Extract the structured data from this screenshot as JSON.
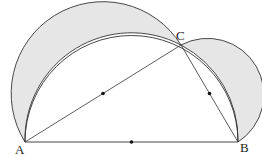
{
  "figure": {
    "type": "lunes-of-hippocrates",
    "labels": {
      "A": "A",
      "B": "B",
      "C": "C"
    },
    "points": {
      "A": [
        25,
        142
      ],
      "B": [
        238,
        142
      ],
      "C": [
        181,
        45
      ]
    },
    "midpoints": {
      "AB": [
        131.5,
        142
      ],
      "AC": [
        103,
        93.5
      ],
      "BC": [
        209.5,
        93.5
      ]
    },
    "colors": {
      "shade": "#e6e6e6",
      "stroke": "#333333",
      "background": "#ffffff"
    }
  }
}
